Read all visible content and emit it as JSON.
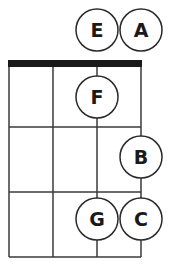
{
  "diagram": {
    "type": "fretboard-note-chart",
    "colors": {
      "line": "#3a3a3a",
      "nut": "#1a1a1a",
      "circle_stroke": "#2a2a2a",
      "circle_fill": "#ffffff",
      "text": "#1a1a1a"
    },
    "strings_x": [
      9,
      53,
      97,
      141
    ],
    "nut": {
      "x1": 8,
      "x2": 142,
      "y": 60,
      "height": 7
    },
    "frets_y": [
      127,
      192,
      257
    ],
    "notes": [
      {
        "label": "E",
        "string": 3,
        "fret": 0,
        "cx": 97,
        "cy": 30
      },
      {
        "label": "A",
        "string": 4,
        "fret": 0,
        "cx": 141,
        "cy": 30
      },
      {
        "label": "F",
        "string": 3,
        "fret": 1,
        "cx": 97,
        "cy": 97
      },
      {
        "label": "B",
        "string": 4,
        "fret": 2,
        "cx": 141,
        "cy": 157
      },
      {
        "label": "G",
        "string": 3,
        "fret": 3,
        "cx": 97,
        "cy": 219
      },
      {
        "label": "C",
        "string": 4,
        "fret": 3,
        "cx": 141,
        "cy": 219
      }
    ],
    "circle_radius": 21
  }
}
